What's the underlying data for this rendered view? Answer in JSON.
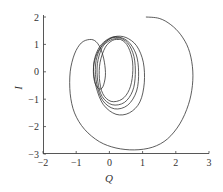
{
  "chart_data": {
    "type": "line",
    "title": "",
    "xlabel": "Q",
    "ylabel": "I",
    "xlim": [
      -2,
      3
    ],
    "ylim": [
      -3,
      2
    ],
    "xticks": [
      -2,
      -1,
      0,
      1,
      2,
      3
    ],
    "yticks": [
      -3,
      -2,
      -1,
      0,
      1,
      2
    ],
    "xtick_labels": [
      "−2",
      "−1",
      "0",
      "1",
      "2",
      "3"
    ],
    "ytick_labels": [
      "−3",
      "−2",
      "−1",
      "0",
      "1",
      "2"
    ],
    "grid": false,
    "legend": null,
    "line_color": "#333333",
    "series": [
      {
        "name": "phase trajectory",
        "points": [
          [
            1.1,
            2.0
          ],
          [
            1.5,
            1.95
          ],
          [
            1.85,
            1.72
          ],
          [
            2.15,
            1.35
          ],
          [
            2.38,
            0.85
          ],
          [
            2.5,
            0.2
          ],
          [
            2.5,
            -0.5
          ],
          [
            2.38,
            -1.2
          ],
          [
            2.12,
            -1.9
          ],
          [
            1.75,
            -2.45
          ],
          [
            1.3,
            -2.75
          ],
          [
            0.75,
            -2.85
          ],
          [
            0.2,
            -2.78
          ],
          [
            -0.3,
            -2.55
          ],
          [
            -0.75,
            -2.1
          ],
          [
            -1.05,
            -1.5
          ],
          [
            -1.18,
            -0.8
          ],
          [
            -1.18,
            0.0
          ],
          [
            -1.05,
            0.65
          ],
          [
            -0.85,
            1.05
          ],
          [
            -0.6,
            1.18
          ],
          [
            -0.4,
            1.1
          ],
          [
            -0.25,
            0.8
          ],
          [
            -0.15,
            0.35
          ],
          [
            -0.12,
            -0.15
          ],
          [
            -0.2,
            -0.55
          ],
          [
            -0.32,
            -0.62
          ],
          [
            -0.45,
            -0.35
          ],
          [
            -0.48,
            0.15
          ],
          [
            -0.38,
            0.65
          ],
          [
            -0.15,
            1.05
          ],
          [
            0.15,
            1.28
          ],
          [
            0.5,
            1.25
          ],
          [
            0.82,
            0.95
          ],
          [
            1.02,
            0.35
          ],
          [
            1.05,
            -0.4
          ],
          [
            0.92,
            -1.1
          ],
          [
            0.6,
            -1.5
          ],
          [
            0.2,
            -1.55
          ],
          [
            -0.18,
            -1.2
          ],
          [
            -0.4,
            -0.55
          ],
          [
            -0.48,
            0.2
          ],
          [
            -0.35,
            0.8
          ],
          [
            -0.1,
            1.15
          ],
          [
            0.2,
            1.28
          ],
          [
            0.55,
            1.12
          ],
          [
            0.8,
            0.65
          ],
          [
            0.88,
            0.0
          ],
          [
            0.82,
            -0.7
          ],
          [
            0.55,
            -1.22
          ],
          [
            0.15,
            -1.35
          ],
          [
            -0.2,
            -1.05
          ],
          [
            -0.38,
            -0.45
          ],
          [
            -0.42,
            0.25
          ],
          [
            -0.28,
            0.85
          ],
          [
            -0.02,
            1.18
          ],
          [
            0.25,
            1.25
          ],
          [
            0.55,
            1.05
          ],
          [
            0.74,
            0.55
          ],
          [
            0.78,
            -0.1
          ],
          [
            0.7,
            -0.7
          ],
          [
            0.45,
            -1.12
          ],
          [
            0.08,
            -1.2
          ],
          [
            -0.22,
            -0.9
          ],
          [
            -0.35,
            -0.35
          ],
          [
            -0.36,
            0.3
          ],
          [
            -0.22,
            0.88
          ],
          [
            0.02,
            1.15
          ],
          [
            0.28,
            1.2
          ],
          [
            0.52,
            1.0
          ],
          [
            0.68,
            0.5
          ],
          [
            0.7,
            -0.1
          ],
          [
            0.6,
            -0.65
          ],
          [
            0.38,
            -1.0
          ],
          [
            0.05,
            -1.08
          ],
          [
            -0.2,
            -0.8
          ],
          [
            -0.3,
            -0.25
          ],
          [
            -0.28,
            0.35
          ],
          [
            -0.12,
            0.9
          ],
          [
            0.1,
            1.15
          ],
          [
            0.3,
            1.18
          ]
        ]
      }
    ]
  }
}
